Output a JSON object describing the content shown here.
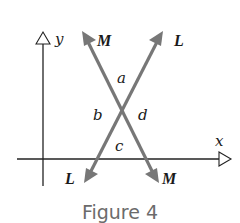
{
  "figure": {
    "caption": "Figure 4",
    "axes": {
      "x_label": "x",
      "y_label": "y"
    },
    "lines": [
      {
        "name": "M",
        "label_top": "M",
        "label_bottom": "M",
        "direction": "falling",
        "color": "#777777"
      },
      {
        "name": "L",
        "label_top": "L",
        "label_bottom": "L",
        "direction": "rising",
        "color": "#777777"
      }
    ],
    "angles": {
      "top": "a",
      "left": "b",
      "right": "d",
      "bottom": "c"
    },
    "colors": {
      "axis": "#222222",
      "arrow_lines": "#777777",
      "caption": "#6b6b6b"
    }
  }
}
